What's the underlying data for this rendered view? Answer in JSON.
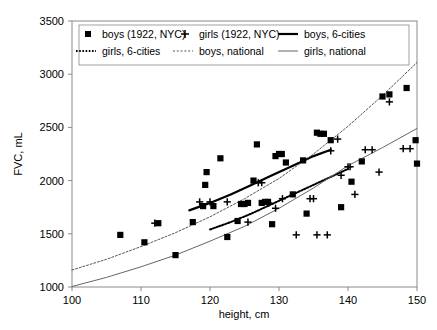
{
  "chart_data": {
    "type": "scatter",
    "title": "",
    "xlabel": "height, cm",
    "ylabel": "FVC, mL",
    "xlim": [
      100,
      150
    ],
    "ylim": [
      1000,
      3500
    ],
    "xticks": [
      100,
      110,
      120,
      130,
      140,
      150
    ],
    "yticks": [
      1000,
      1500,
      2000,
      2500,
      3000,
      3500
    ],
    "grid": false,
    "legend_position": "top-inside",
    "legend": [
      {
        "label": "boys (1922, NYC)",
        "marker": "square",
        "style": "marker"
      },
      {
        "label": "girls (1922, NYC)",
        "marker": "plus",
        "style": "marker"
      },
      {
        "label": "boys, 6-cities",
        "marker": "line-thick",
        "style": "line"
      },
      {
        "label": "girls, 6-cities",
        "marker": "line-dotted-thick",
        "style": "line"
      },
      {
        "label": "boys, national",
        "marker": "line-dotted-thin",
        "style": "line"
      },
      {
        "label": "girls, national",
        "marker": "line-thin",
        "style": "line"
      }
    ],
    "series": [
      {
        "name": "boys (1922, NYC)",
        "marker": "square",
        "points": [
          [
            107.0,
            1490
          ],
          [
            110.5,
            1420
          ],
          [
            112.5,
            1600
          ],
          [
            115.0,
            1300
          ],
          [
            117.5,
            1610
          ],
          [
            119.0,
            1760
          ],
          [
            119.3,
            1960
          ],
          [
            119.5,
            2080
          ],
          [
            120.5,
            1760
          ],
          [
            121.5,
            2210
          ],
          [
            122.5,
            1470
          ],
          [
            124.0,
            1620
          ],
          [
            124.5,
            1780
          ],
          [
            125.0,
            1780
          ],
          [
            125.5,
            1790
          ],
          [
            126.3,
            2000
          ],
          [
            126.8,
            2340
          ],
          [
            127.5,
            1790
          ],
          [
            128.0,
            1800
          ],
          [
            128.4,
            1800
          ],
          [
            129.0,
            1590
          ],
          [
            129.5,
            2230
          ],
          [
            130.0,
            2250
          ],
          [
            130.4,
            2250
          ],
          [
            131.0,
            2170
          ],
          [
            132.0,
            1870
          ],
          [
            133.5,
            2190
          ],
          [
            134.0,
            1690
          ],
          [
            135.5,
            2450
          ],
          [
            136.0,
            2440
          ],
          [
            136.5,
            2440
          ],
          [
            137.5,
            2380
          ],
          [
            139.0,
            1750
          ],
          [
            140.5,
            1990
          ],
          [
            142.0,
            2180
          ],
          [
            145.0,
            2790
          ],
          [
            146.0,
            2810
          ],
          [
            148.5,
            2870
          ],
          [
            149.8,
            2380
          ],
          [
            150.0,
            2160
          ]
        ]
      },
      {
        "name": "girls (1922, NYC)",
        "marker": "plus",
        "points": [
          [
            112.0,
            1600
          ],
          [
            118.5,
            1800
          ],
          [
            120.0,
            1800
          ],
          [
            122.5,
            1800
          ],
          [
            125.5,
            1610
          ],
          [
            127.0,
            1980
          ],
          [
            127.5,
            1980
          ],
          [
            128.5,
            1790
          ],
          [
            129.5,
            1740
          ],
          [
            130.5,
            1830
          ],
          [
            132.5,
            1490
          ],
          [
            134.5,
            1830
          ],
          [
            135.0,
            1830
          ],
          [
            135.5,
            1490
          ],
          [
            137.0,
            1490
          ],
          [
            137.5,
            2280
          ],
          [
            138.5,
            2390
          ],
          [
            139.0,
            2050
          ],
          [
            140.0,
            2130
          ],
          [
            140.3,
            2130
          ],
          [
            141.0,
            1870
          ],
          [
            142.5,
            2290
          ],
          [
            143.5,
            2290
          ],
          [
            144.5,
            2080
          ],
          [
            146.0,
            2740
          ],
          [
            148.0,
            2300
          ],
          [
            149.0,
            2300
          ]
        ]
      },
      {
        "name": "boys, 6-cities",
        "style": "line-thick",
        "x": [
          117.0,
          120.0,
          123.0,
          126.0,
          129.0,
          132.0,
          135.0,
          137.5
        ],
        "y": [
          1720,
          1790,
          1870,
          1960,
          2050,
          2140,
          2230,
          2290
        ]
      },
      {
        "name": "girls, 6-cities",
        "style": "line-dotted-thick",
        "x": [
          120.0,
          123.0,
          126.0,
          129.0,
          132.0,
          135.0,
          138.0,
          140.0
        ],
        "y": [
          1540,
          1610,
          1690,
          1780,
          1870,
          1960,
          2050,
          2110
        ]
      },
      {
        "name": "boys, national",
        "style": "line-dotted-thin",
        "x": [
          100,
          105,
          110,
          115,
          120,
          125,
          130,
          135,
          140,
          145,
          150
        ],
        "y": [
          1160,
          1260,
          1380,
          1510,
          1660,
          1830,
          2020,
          2250,
          2510,
          2800,
          3110
        ]
      },
      {
        "name": "girls, national",
        "style": "line-thin",
        "x": [
          100,
          105,
          110,
          115,
          120,
          125,
          130,
          135,
          140,
          145,
          150
        ],
        "y": [
          1005,
          1090,
          1190,
          1300,
          1430,
          1570,
          1740,
          1930,
          2140,
          2310,
          2490
        ]
      }
    ]
  }
}
